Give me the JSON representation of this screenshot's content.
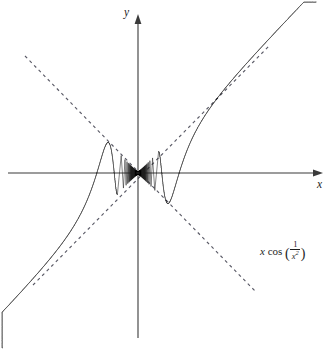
{
  "chart_data": {
    "type": "line",
    "title": "",
    "function_expression": "x cos(1/x^2)",
    "function_label_parts": {
      "variable": "x",
      "operator": "cos",
      "open_paren": "(",
      "numerator": "1",
      "denominator_base": "x",
      "denominator_exponent": "2",
      "close_paren": ")"
    },
    "xlabel": "x",
    "ylabel": "y",
    "xlim": [
      -3.45,
      3.45
    ],
    "ylim": [
      -3.2,
      3.1
    ],
    "grid": false,
    "legend": "none",
    "axes": {
      "x_axis_visible": true,
      "y_axis_visible": true,
      "x_axis_arrow": true,
      "y_axis_arrow": true,
      "tick_labels": []
    },
    "envelopes": [
      {
        "name": "upper-envelope",
        "expression": "y = x",
        "style": "dashed",
        "color": "#5a5a66"
      },
      {
        "name": "lower-envelope",
        "expression": "y = -x",
        "style": "dashed",
        "color": "#5a5a66"
      }
    ],
    "series": [
      {
        "name": "x cos(1/x^2)",
        "color": "#1d1d1d",
        "style": "solid",
        "description": "Oscillation amplitude grows linearly with |x|; frequency diverges as x approaches 0, producing a dense shaded wedge near the origin.",
        "x": [
          -3.45,
          -3.2,
          -2.9,
          -2.6,
          -2.3,
          -2.0,
          -1.7,
          -1.4,
          -1.1,
          -0.9,
          -0.7,
          -0.5,
          -0.35,
          -0.2,
          -0.1,
          0.0,
          0.1,
          0.2,
          0.35,
          0.5,
          0.7,
          0.9,
          1.1,
          1.4,
          1.7,
          2.0,
          2.3,
          2.6,
          2.9,
          3.2,
          3.45
        ],
        "y": [
          3.16,
          2.27,
          0.55,
          -1.64,
          -2.3,
          -0.16,
          1.6,
          0.77,
          -1.09,
          0.79,
          0.63,
          -0.46,
          0.29,
          0.15,
          -0.07,
          0.0,
          0.07,
          -0.15,
          -0.29,
          0.46,
          -0.63,
          -0.79,
          1.09,
          -0.77,
          -1.6,
          0.16,
          2.3,
          1.64,
          -0.55,
          -2.27,
          -3.16
        ]
      }
    ],
    "annotations": [
      {
        "name": "function-label",
        "text": "x cos (1/x²)",
        "position": "bottom-right"
      }
    ],
    "colors": {
      "curve": "#1d1d1d",
      "axis": "#3a3a3a",
      "envelope": "#5a5a66",
      "background": "#ffffff"
    }
  }
}
